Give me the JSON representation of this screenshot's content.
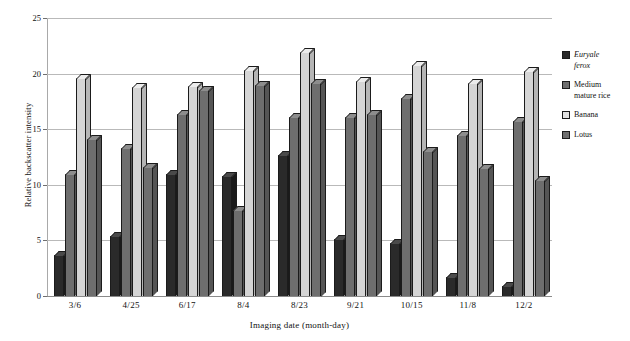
{
  "chart_data": {
    "type": "bar",
    "title": "",
    "subtitle": "",
    "xlabel": "Imaging date (month-day)",
    "ylabel": "Relative backscatter intensity",
    "categories": [
      "3/6",
      "4/25",
      "6/17",
      "8/4",
      "8/23",
      "9/21",
      "10/15",
      "11/8",
      "12/2"
    ],
    "ylim": [
      0,
      25
    ],
    "yticks": [
      0,
      5,
      10,
      15,
      20,
      25
    ],
    "ytick_labels": [
      "0",
      "5",
      "10",
      "15",
      "20",
      "25"
    ],
    "grid": true,
    "grid_axis": "y",
    "legend_position": "right",
    "style": "3d-grouped-bars-grayscale",
    "series": [
      {
        "name": "Euryale ferox",
        "italic": true,
        "color": "#2a2a2a",
        "values": [
          3.7,
          5.4,
          11.0,
          10.8,
          12.7,
          5.1,
          4.8,
          1.7,
          0.9
        ]
      },
      {
        "name": "Medium mature rice",
        "italic": false,
        "color": "#6e6e6e",
        "values": [
          11.0,
          13.3,
          16.4,
          7.7,
          16.1,
          16.1,
          17.8,
          14.5,
          15.7
        ]
      },
      {
        "name": "Banana",
        "italic": false,
        "color": "#e2e2e2",
        "values": [
          19.6,
          18.8,
          18.9,
          20.3,
          21.9,
          19.3,
          20.8,
          19.2,
          20.2
        ]
      },
      {
        "name": "Lotus",
        "italic": false,
        "color": "#6e6e6e",
        "values": [
          14.1,
          11.6,
          18.5,
          19.0,
          19.2,
          16.4,
          13.0,
          11.5,
          10.4
        ]
      }
    ]
  },
  "legend": {
    "items": [
      {
        "label_line1": "Euryale",
        "label_line2": "ferox",
        "italic": true
      },
      {
        "label_line1": "Medium",
        "label_line2": "mature rice",
        "italic": false
      },
      {
        "label_line1": "Banana",
        "label_line2": "",
        "italic": false
      },
      {
        "label_line1": "Lotus",
        "label_line2": "",
        "italic": false
      }
    ]
  }
}
